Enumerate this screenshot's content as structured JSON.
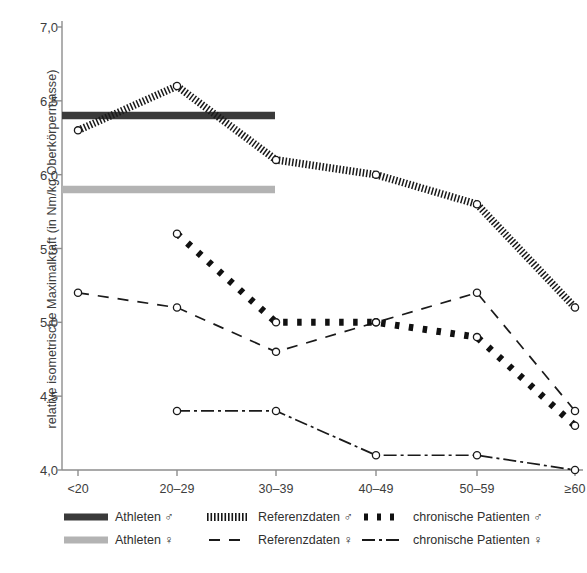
{
  "axes": {
    "y_title": "relative isometrische Maximalkraft (in Nm/kg Oberkörpermasse)",
    "y_ticks": [
      "7,0",
      "6,5",
      "6,0",
      "5,5",
      "5,0",
      "4,5",
      "4,0"
    ],
    "x_ticks": [
      "<20",
      "20–29",
      "30–39",
      "40–49",
      "50–59",
      "≥60"
    ]
  },
  "legend": {
    "items": [
      {
        "label": "Athleten ♂",
        "style": "thick-solid-dark",
        "color": "#3a3a3a"
      },
      {
        "label": "Referenzdaten ♂",
        "style": "dense-hatch",
        "color": "#1a1a1a"
      },
      {
        "label": "chronische Patienten ♂",
        "style": "thick-dash",
        "color": "#111111"
      },
      {
        "label": "Athleten ♀",
        "style": "thick-solid-gray",
        "color": "#b3b3b3"
      },
      {
        "label": "Referenzdaten ♀",
        "style": "dashed",
        "color": "#1a1a1a"
      },
      {
        "label": "chronische Patienten ♀",
        "style": "dash-dot",
        "color": "#1a1a1a"
      }
    ]
  },
  "caption": "",
  "chart_data": {
    "type": "line",
    "title": "",
    "xlabel": "",
    "ylabel": "relative isometrische Maximalkraft (in Nm/kg Oberkörpermasse)",
    "categories": [
      "<20",
      "20–29",
      "30–39",
      "40–49",
      "50–59",
      "≥60"
    ],
    "ylim": [
      4.0,
      7.0
    ],
    "ytick_values": [
      7.0,
      6.5,
      6.0,
      5.5,
      5.0,
      4.5,
      4.0
    ],
    "grid": false,
    "legend_position": "bottom",
    "series": [
      {
        "name": "Athleten ♂",
        "style": "thick-solid-dark",
        "color": "#3a3a3a",
        "kind": "constant-band",
        "constant_value": 6.4,
        "span_categories": [
          "<20",
          "30–39"
        ],
        "values": [
          6.4,
          6.4,
          6.4,
          null,
          null,
          null
        ],
        "markers": false
      },
      {
        "name": "Athleten ♀",
        "style": "thick-solid-gray",
        "color": "#b3b3b3",
        "kind": "constant-band",
        "constant_value": 5.9,
        "span_categories": [
          "<20",
          "30–39"
        ],
        "values": [
          5.9,
          5.9,
          5.9,
          null,
          null,
          null
        ],
        "markers": false
      },
      {
        "name": "Referenzdaten ♂",
        "style": "dense-hatch",
        "color": "#1a1a1a",
        "values": [
          6.3,
          6.6,
          6.1,
          6.0,
          5.8,
          5.1
        ],
        "markers": true
      },
      {
        "name": "Referenzdaten ♀",
        "style": "dashed",
        "color": "#1a1a1a",
        "values": [
          5.2,
          5.1,
          4.8,
          5.0,
          5.2,
          4.4
        ],
        "markers": true
      },
      {
        "name": "chronische Patienten ♂",
        "style": "thick-dash",
        "color": "#111111",
        "values": [
          null,
          5.6,
          5.0,
          5.0,
          4.9,
          4.3
        ],
        "markers": true
      },
      {
        "name": "chronische Patienten ♀",
        "style": "dash-dot",
        "color": "#1a1a1a",
        "values": [
          null,
          4.4,
          4.4,
          4.1,
          4.1,
          4.0
        ],
        "markers": true
      }
    ]
  }
}
